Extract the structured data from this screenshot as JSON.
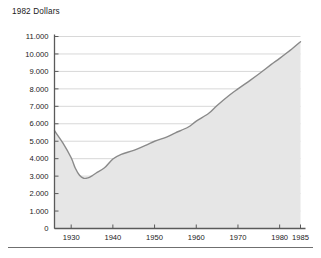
{
  "chart_data": {
    "type": "area",
    "title": "1982 Dollars",
    "xlabel": "",
    "ylabel": "",
    "xlim": [
      1926,
      1985
    ],
    "ylim": [
      0,
      11000
    ],
    "grid": true,
    "grid_axis": "y",
    "legend": false,
    "fill_color": "#e6e6e6",
    "line_color": "#8a8a8a",
    "axis_color": "#5a5a5a",
    "grid_color": "#d8d8d8",
    "y_ticks": [
      0,
      1000,
      2000,
      3000,
      4000,
      5000,
      6000,
      7000,
      8000,
      9000,
      10000,
      11000
    ],
    "y_tick_labels": [
      "0",
      "1.000",
      "2.000",
      "3.000",
      "4.000",
      "5.000",
      "6.000",
      "7.000",
      "8.000",
      "9.000",
      "10.000",
      "11.000"
    ],
    "x_ticks": [
      1930,
      1940,
      1950,
      1960,
      1970,
      1980,
      1985
    ],
    "x_tick_labels": [
      "1930",
      "1940",
      "1950",
      "1960",
      "1970",
      "1980",
      "1985"
    ],
    "x": [
      1926,
      1928,
      1930,
      1931,
      1932,
      1933,
      1934,
      1935,
      1936,
      1938,
      1940,
      1942,
      1945,
      1948,
      1950,
      1953,
      1955,
      1958,
      1960,
      1963,
      1965,
      1968,
      1970,
      1973,
      1975,
      1978,
      1980,
      1983,
      1985
    ],
    "values": [
      5600,
      4900,
      4050,
      3450,
      3050,
      2880,
      2900,
      3020,
      3180,
      3480,
      3980,
      4250,
      4480,
      4780,
      5000,
      5250,
      5480,
      5800,
      6150,
      6600,
      7050,
      7650,
      8000,
      8500,
      8850,
      9400,
      9750,
      10300,
      10700
    ],
    "series_name": "1982 Dollars"
  }
}
